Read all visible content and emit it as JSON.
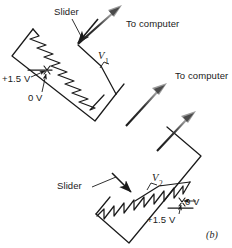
{
  "figure": {
    "caption": "(b)",
    "background_color": "#ffffff",
    "line_color": "#1a1a1a",
    "text_color": "#1a1a1a"
  },
  "potentiometer_top": {
    "slider_label": "Slider",
    "output_label": "To computer",
    "voltage_label": "V",
    "voltage_subscript": "1",
    "supply_label": "+1.5 V",
    "ground_label": "0 V"
  },
  "potentiometer_bottom": {
    "slider_label": "Slider",
    "output_label": "To computer",
    "voltage_label": "V",
    "voltage_subscript": "2",
    "supply_label": "+1.5 V",
    "ground_label": "0 V"
  },
  "icons": {
    "arrow_to_computer": "arrow-up-right-icon",
    "arrow_slider": "arrow-down-right-icon",
    "arrow_leader": "leader-line-icon",
    "resistor": "zigzag-resistor-icon",
    "node": "terminal-node-icon"
  }
}
